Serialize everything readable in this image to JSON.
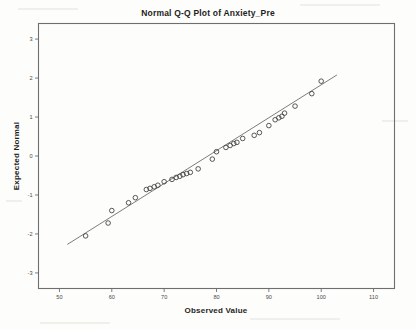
{
  "chart_data": {
    "type": "scatter",
    "title": "Normal Q-Q Plot of Anxiety_Pre",
    "xlabel": "Observed Value",
    "ylabel": "Expected Normal",
    "xlim": [
      46,
      114
    ],
    "ylim": [
      -3.4,
      3.4
    ],
    "grid": false,
    "legend": null,
    "xticks": [
      "50",
      "60",
      "70",
      "80",
      "90",
      "100",
      "110"
    ],
    "xtick_values": [
      50,
      60,
      70,
      80,
      90,
      100,
      110
    ],
    "yticks": [
      "3",
      "2",
      "1",
      "0",
      "-1",
      "-2",
      "-3"
    ],
    "ytick_values": [
      3,
      2,
      1,
      0,
      -1,
      -2,
      -3
    ],
    "marker_style": "open-circle",
    "reference_line": {
      "x": [
        51.5,
        103.0
      ],
      "y": [
        -2.27,
        2.08
      ]
    },
    "points": [
      {
        "x": 55.0,
        "y": -2.05
      },
      {
        "x": 59.3,
        "y": -1.72
      },
      {
        "x": 60.0,
        "y": -1.4
      },
      {
        "x": 63.2,
        "y": -1.2
      },
      {
        "x": 64.5,
        "y": -1.07
      },
      {
        "x": 66.6,
        "y": -0.86
      },
      {
        "x": 67.3,
        "y": -0.83
      },
      {
        "x": 68.1,
        "y": -0.79
      },
      {
        "x": 68.8,
        "y": -0.75
      },
      {
        "x": 70.0,
        "y": -0.66
      },
      {
        "x": 71.5,
        "y": -0.6
      },
      {
        "x": 72.3,
        "y": -0.55
      },
      {
        "x": 73.0,
        "y": -0.52
      },
      {
        "x": 73.6,
        "y": -0.48
      },
      {
        "x": 74.3,
        "y": -0.45
      },
      {
        "x": 75.0,
        "y": -0.42
      },
      {
        "x": 76.5,
        "y": -0.33
      },
      {
        "x": 79.2,
        "y": -0.08
      },
      {
        "x": 80.0,
        "y": 0.11
      },
      {
        "x": 81.8,
        "y": 0.22
      },
      {
        "x": 82.6,
        "y": 0.27
      },
      {
        "x": 83.3,
        "y": 0.32
      },
      {
        "x": 83.9,
        "y": 0.35
      },
      {
        "x": 85.0,
        "y": 0.45
      },
      {
        "x": 87.2,
        "y": 0.53
      },
      {
        "x": 88.2,
        "y": 0.6
      },
      {
        "x": 90.0,
        "y": 0.78
      },
      {
        "x": 91.2,
        "y": 0.93
      },
      {
        "x": 91.9,
        "y": 0.98
      },
      {
        "x": 92.5,
        "y": 1.02
      },
      {
        "x": 93.0,
        "y": 1.1
      },
      {
        "x": 95.0,
        "y": 1.28
      },
      {
        "x": 98.2,
        "y": 1.6
      },
      {
        "x": 100.0,
        "y": 1.92
      }
    ]
  }
}
